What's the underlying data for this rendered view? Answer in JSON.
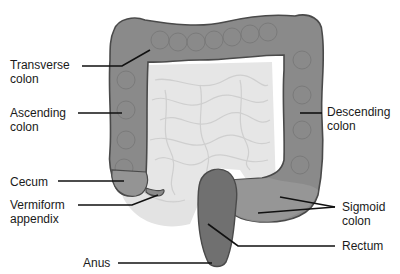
{
  "figure": {
    "colors": {
      "background": "#ffffff",
      "colon_fill": "#8a8a8a",
      "colon_fill_light": "#9a9a9a",
      "colon_outline": "#4a4a4a",
      "small_intestine_fill": "#e6e6e6",
      "small_intestine_lines": "#cfcfcf",
      "rectum_fill": "#6e6e6e",
      "leader_line": "#111111",
      "label_text": "#1a1a1a"
    }
  },
  "labels": [
    {
      "id": "transverse-colon",
      "text": "Transverse\ncolon"
    },
    {
      "id": "ascending-colon",
      "text": "Ascending\ncolon"
    },
    {
      "id": "descending-colon",
      "text": "Descending\ncolon"
    },
    {
      "id": "cecum",
      "text": "Cecum"
    },
    {
      "id": "vermiform-appendix",
      "text": "Vermiform\nappendix"
    },
    {
      "id": "sigmoid-colon",
      "text": "Sigmoid\ncolon"
    },
    {
      "id": "rectum",
      "text": "Rectum"
    },
    {
      "id": "anus",
      "text": "Anus"
    }
  ]
}
